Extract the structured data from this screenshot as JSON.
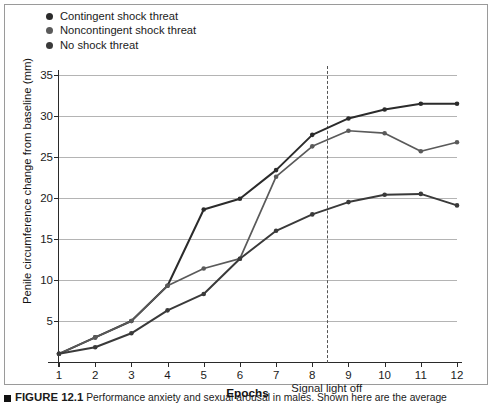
{
  "figure": {
    "caption_marker": "square-bullet",
    "caption_figure_number": "FIGURE 12.1",
    "caption_text": "Performance anxiety and sexual arousal in males. Shown here are the average"
  },
  "legend": {
    "position": "top-left",
    "items": [
      {
        "label": "Contingent shock threat",
        "color": "#2b2b2b"
      },
      {
        "label": "Noncontingent shock threat",
        "color": "#5a5a5a"
      },
      {
        "label": "No shock threat",
        "color": "#3a3a3a"
      }
    ]
  },
  "annotation": {
    "signal_light_off_label": "Signal light off",
    "signal_light_off_x": 8.4
  },
  "chart_data": {
    "type": "line",
    "title": "",
    "xlabel": "Epochs",
    "ylabel": "Penile circumference change from baseline (mm)",
    "x": [
      1,
      2,
      3,
      4,
      5,
      6,
      7,
      8,
      9,
      10,
      11,
      12
    ],
    "xlim": [
      1,
      12
    ],
    "ylim": [
      0,
      35
    ],
    "yticks": [
      5,
      10,
      15,
      20,
      25,
      30,
      35
    ],
    "xticks": [
      1,
      2,
      3,
      4,
      5,
      6,
      7,
      8,
      9,
      10,
      11,
      12
    ],
    "grid": "horizontal",
    "legend_position": "top-left",
    "series": [
      {
        "name": "Contingent shock threat",
        "color": "#2b2b2b",
        "values": [
          1.0,
          3.0,
          5.0,
          9.3,
          18.6,
          19.9,
          23.4,
          27.7,
          29.7,
          30.8,
          31.5,
          31.5
        ]
      },
      {
        "name": "Noncontingent shock threat",
        "color": "#5a5a5a",
        "values": [
          1.0,
          3.0,
          5.0,
          9.3,
          11.4,
          12.6,
          22.6,
          26.3,
          28.2,
          27.9,
          25.7,
          26.8
        ]
      },
      {
        "name": "No shock threat",
        "color": "#3a3a3a",
        "values": [
          1.0,
          1.8,
          3.5,
          6.3,
          8.3,
          12.6,
          16.0,
          18.0,
          19.5,
          20.4,
          20.5,
          19.1
        ]
      }
    ]
  }
}
